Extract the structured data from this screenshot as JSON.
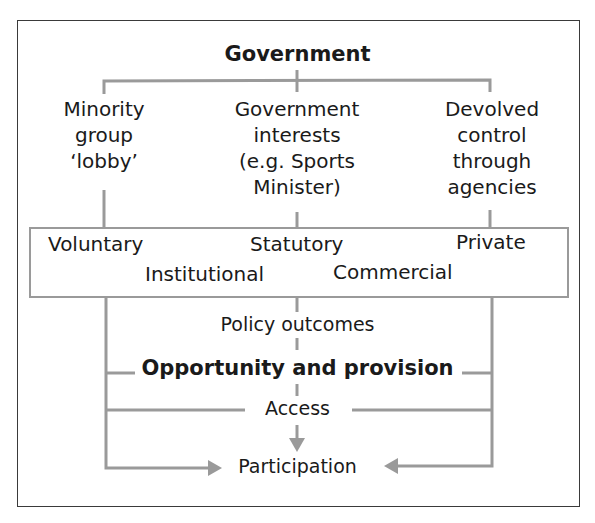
{
  "diagram": {
    "root": "Government",
    "branches": [
      {
        "lines": [
          "Minority",
          "group",
          "‘lobby’"
        ]
      },
      {
        "lines": [
          "Government",
          "interests",
          "(e.g. Sports",
          "Minister)"
        ]
      },
      {
        "lines": [
          "Devolved",
          "control",
          "through",
          "agencies"
        ]
      }
    ],
    "sectors": {
      "row1": [
        "Voluntary",
        "Statutory",
        "Private"
      ],
      "row2": [
        "Institutional",
        "Commercial"
      ]
    },
    "flow": {
      "policy": "Policy outcomes",
      "opportunity": "Opportunity and provision",
      "access": "Access",
      "participation": "Participation"
    },
    "colors": {
      "lines": "#9a9a9a",
      "frame": "#3a3a3a",
      "text": "#1a1a1a"
    }
  }
}
